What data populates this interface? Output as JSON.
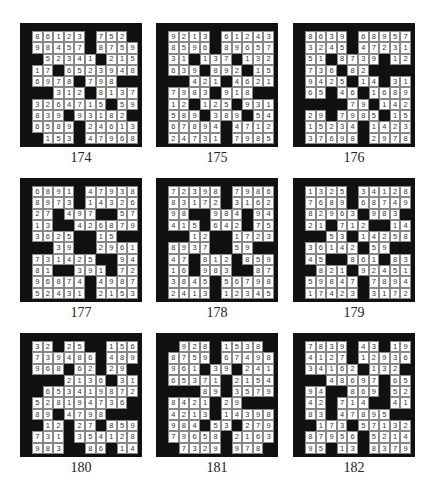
{
  "puzzles": [
    {
      "number": "174",
      "rows": [
        "86123#752#",
        "98457#8759",
        "#52341#215",
        "17#6523948",
        "6978#798##",
        "##312#8137",
        "3264715#59",
        "839#93182#",
        "6589#24613",
        "#153#47968"
      ]
    },
    {
      "number": "175",
      "rows": [
        "9213#61243",
        "8596#89657",
        "31#137#132",
        "639#892#15",
        "##421#4621",
        "7983#918##",
        "12#125#931",
        "589#389#54",
        "67894#4712",
        "24731#7985"
      ]
    },
    {
      "number": "176",
      "rows": [
        "8639#68957",
        "3245#47231",
        "51#8739#12",
        "736#82####",
        "9425#14#31",
        "65#46#1689",
        "####79#142",
        "29#7985#15",
        "15234#1423",
        "37698#2978"
      ]
    },
    {
      "number": "177",
      "rows": [
        "6891#47938",
        "8973#14326",
        "27#497##57",
        "13##426879",
        "3625##15##",
        "##39##2961",
        "731425##94",
        "81##391#72",
        "96874#4987",
        "52431#2153"
      ]
    },
    {
      "number": "178",
      "rows": [
        "72398#7986",
        "83172#3162",
        "98##984#94",
        "415#642#75",
        "##12##1723",
        "8937##59##",
        "47#812#859",
        "16#983##87",
        "3845#56798",
        "2413#12345"
      ]
    },
    {
      "number": "179",
      "rows": [
        "1325#34128",
        "7689#68749",
        "82963#983#",
        "21#712##14",
        "##53#14258",
        "36142#59##",
        "45##861#83",
        "#821#92451",
        "59847#7894",
        "17423#3172"
      ]
    },
    {
      "number": "180",
      "rows": [
        "32#25##156",
        "739486#489",
        "968#62#29#",
        "###2136#31",
        "#653419872",
        "528194736#",
        "89#4798###",
        "#12#27#859",
        "731#354128",
        "983##86#14"
      ]
    },
    {
      "number": "181",
      "rows": [
        "#928#1538#",
        "8759#67498",
        "961#39#241",
        "65371#2154",
        "###89#3579",
        "8421#29###",
        "4213#14398",
        "984#53#279",
        "79658#2163",
        "#7329#978#"
      ]
    },
    {
      "number": "182",
      "rows": [
        "7839#43#19",
        "4127#12936",
        "34162#132#",
        "##48697#65",
        "94##869#52",
        "42#714##41",
        "83#47895##",
        "#173#57132",
        "87956#5214",
        "95#13#8379"
      ]
    }
  ],
  "positions": [
    {
      "x": 20,
      "y": 23
    },
    {
      "x": 156,
      "y": 23
    },
    {
      "x": 293,
      "y": 23
    },
    {
      "x": 20,
      "y": 178
    },
    {
      "x": 156,
      "y": 178
    },
    {
      "x": 293,
      "y": 178
    },
    {
      "x": 20,
      "y": 333
    },
    {
      "x": 156,
      "y": 333
    },
    {
      "x": 293,
      "y": 333
    }
  ]
}
